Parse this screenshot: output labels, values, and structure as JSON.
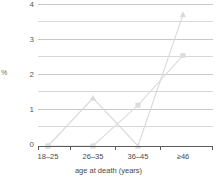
{
  "chart_data": {
    "type": "line",
    "title": "",
    "xlabel": "age at death (years)",
    "ylabel": "%",
    "categories": [
      "18–25",
      "26–35",
      "36–45",
      "≥46"
    ],
    "ylim": [
      0,
      4
    ],
    "yticks": [
      0,
      1,
      2,
      3,
      4
    ],
    "ytick_labels": [
      "0",
      "1",
      "2",
      "3",
      "4"
    ],
    "gridlines": [
      0.5,
      1,
      1.5,
      2,
      2.5,
      3,
      3.5,
      4
    ],
    "grid": true,
    "legend": "none",
    "series": [
      {
        "name": "series-1",
        "marker": "triangle",
        "color": "#d9d9d9",
        "values": [
          0,
          1.35,
          0,
          3.7
        ]
      },
      {
        "name": "series-2",
        "marker": "square",
        "color": "#dcdcdc",
        "values": [
          0,
          0,
          1.15,
          2.55
        ]
      }
    ]
  },
  "axis": {
    "y_label": "%",
    "x_title": "age at death (years)",
    "y_tick_0": "0",
    "y_tick_1": "1",
    "y_tick_2": "2",
    "y_tick_3": "3",
    "y_tick_4": "4",
    "x_tick_0": "18–25",
    "x_tick_1": "26–35",
    "x_tick_2": "36–45",
    "x_tick_3": "≥46"
  },
  "colors": {
    "gridline": "#c9c9c9",
    "axis": "#5a5a5a",
    "series_1": "#d9d9d9",
    "series_2": "#dcdcdc",
    "text": "#4a4a4a"
  }
}
